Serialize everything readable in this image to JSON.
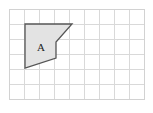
{
  "figure": {
    "background_color": "#ffffff",
    "grid": {
      "line_color": "#d9d9d9",
      "border_color": "#d2d2d2",
      "cell_size": 15,
      "columns": 9,
      "rows": 6,
      "origin_x": 9,
      "origin_y": 9,
      "width": 135,
      "height": 90
    },
    "shapes": [
      {
        "label": "A",
        "label_x": 41,
        "label_y": 51,
        "fill_color": "#e3e3e3",
        "stroke_color": "#555555",
        "stroke_width": 1.3,
        "points": "25,24 72,24 56,42 56,58 25,68",
        "vertices": [
          {
            "x": 25,
            "y": 24
          },
          {
            "x": 72,
            "y": 24
          },
          {
            "x": 56,
            "y": 42
          },
          {
            "x": 56,
            "y": 58
          },
          {
            "x": 25,
            "y": 68
          }
        ]
      }
    ]
  },
  "chart_data": {
    "type": "diagram",
    "grid": {
      "columns": 9,
      "rows": 6,
      "cell_size_px": 15,
      "x_range": [
        0,
        9
      ],
      "y_range": [
        0,
        6
      ],
      "grid_on": true
    },
    "polygons": [
      {
        "name": "A",
        "grid_vertices": [
          {
            "x": 1.07,
            "y": 5.0
          },
          {
            "x": 4.2,
            "y": 5.0
          },
          {
            "x": 3.13,
            "y": 3.8
          },
          {
            "x": 3.13,
            "y": 2.73
          },
          {
            "x": 1.07,
            "y": 2.07
          }
        ],
        "fill": "#e3e3e3",
        "stroke": "#555555"
      }
    ],
    "legend": [],
    "xlabel": "",
    "ylabel": ""
  }
}
